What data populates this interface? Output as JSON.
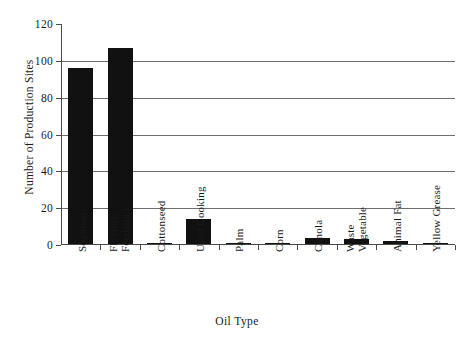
{
  "chart_data": {
    "type": "bar",
    "title": "",
    "xlabel": "Oil Type",
    "ylabel": "Number of Production Sites",
    "categories": [
      "Soybean",
      "Flexible Feedstock",
      "Cottonseed",
      "Used Cooking",
      "Palm",
      "Corn",
      "Canola",
      "Waste Vegetable",
      "Animal Fat",
      "Yellow Grease"
    ],
    "values": [
      96,
      107,
      1,
      14,
      1,
      1,
      4,
      3,
      2,
      1
    ],
    "ylim": [
      0,
      120
    ],
    "yticks": [
      0,
      20,
      40,
      60,
      80,
      100,
      120
    ],
    "ytick_labels": [
      "0",
      "20",
      "40",
      "60",
      "80",
      "100",
      "120"
    ],
    "grid": "horizontal",
    "legend": "none",
    "bar_color": "#111111",
    "grid_color": "#6e6e6e",
    "axis_color": "#4a4a4a",
    "background_color": "#ffffff"
  },
  "labels": {
    "category_lines": [
      [
        "Soybean"
      ],
      [
        "Flexible",
        "Feedstock"
      ],
      [
        "Cottonseed"
      ],
      [
        "Used Cooking"
      ],
      [
        "Palm"
      ],
      [
        "Corn"
      ],
      [
        "Canola"
      ],
      [
        "Waste",
        "Vegetable"
      ],
      [
        "Animal Fat"
      ],
      [
        "Yellow Grease"
      ]
    ]
  }
}
